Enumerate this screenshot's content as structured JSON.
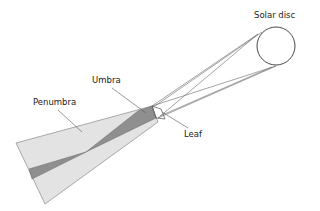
{
  "diagram": {
    "labels": {
      "solar_disc": "Solar disc",
      "umbra": "Umbra",
      "penumbra": "Penumbra",
      "leaf": "Leaf"
    },
    "colors": {
      "penumbra_fill": "#e3e3e3",
      "umbra_fill": "#8f8f8f",
      "line": "#555555",
      "background": "#ffffff"
    }
  }
}
